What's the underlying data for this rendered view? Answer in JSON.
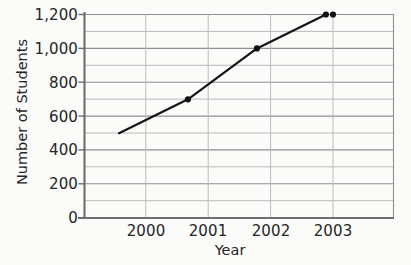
{
  "chart_data": {
    "type": "line",
    "title": "",
    "xlabel": "Year",
    "ylabel": "Number of Students",
    "categories": [
      "2000",
      "2001",
      "2002",
      "2003"
    ],
    "x": [
      2000,
      2001,
      2002,
      2003
    ],
    "values": [
      500,
      700,
      1000,
      1200
    ],
    "series": [
      {
        "name": "Number of Students",
        "values": [
          500,
          700,
          1000,
          1200
        ]
      }
    ],
    "xlim": [
      1999.5,
      2003.98
    ],
    "ylim": [
      0,
      1200
    ],
    "y_major_ticks": [
      0,
      200,
      400,
      600,
      800,
      1000,
      1200
    ],
    "y_major_tick_labels": [
      "0",
      "200",
      "400",
      "600",
      "800",
      "1,000",
      "1,200"
    ],
    "y_minor_step": 100,
    "x_tick_labels": [
      "2000",
      "2001",
      "2002",
      "2003"
    ],
    "grid": true,
    "grid_horizontal": true,
    "grid_vertical": true,
    "legend": false,
    "legend_position": "none",
    "markers": "filled-circle",
    "colors": {
      "background": "#fbfbf9",
      "line": "#111111",
      "marker": "#111111",
      "grid_major": "#9a9a9a",
      "grid_minor": "#b4b4b4",
      "grid_vertical": "#c0c0c0",
      "axis": "#6d6d6d",
      "text": "#252525"
    }
  },
  "axes": {
    "y_title": "Number of Students",
    "x_title": "Year",
    "y_labels": [
      {
        "text": "1,200",
        "value": 1200
      },
      {
        "text": "1,000",
        "value": 1000
      },
      {
        "text": "800",
        "value": 800
      },
      {
        "text": "600",
        "value": 600
      },
      {
        "text": "400",
        "value": 400
      },
      {
        "text": "200",
        "value": 200
      },
      {
        "text": "0",
        "value": 0
      }
    ],
    "x_labels": [
      {
        "text": "2000",
        "value": 2000
      },
      {
        "text": "2001",
        "value": 2001
      },
      {
        "text": "2002",
        "value": 2002
      },
      {
        "text": "2003",
        "value": 2003
      }
    ]
  }
}
